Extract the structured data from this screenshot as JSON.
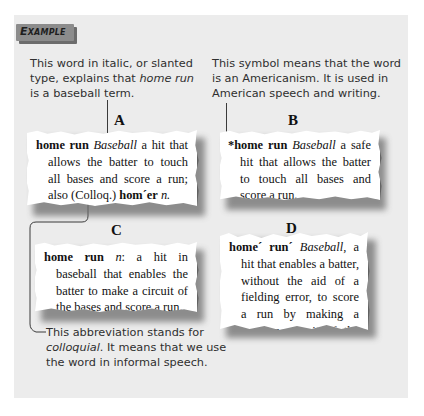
{
  "badge": {
    "label": "Example"
  },
  "annotations": {
    "italic_note": {
      "pre": "This word in italic, or slanted type, explains that ",
      "italic": "home run",
      "post": " is a baseball term."
    },
    "symbol_note": {
      "text": "This symbol means that the word is an Americanism. It is used in American speech and writing."
    },
    "abbrev_note": {
      "italic": "colloquial",
      "pre": "This abbreviation stands for ",
      "post": ". It means that we use the word in informal speech."
    }
  },
  "entries": [
    {
      "label": "A",
      "headword": "home run",
      "italic": "Baseball",
      "text": " a hit that allows the batter to touch all bases and score a run; also (Colloq.) ",
      "variant": "hom´er",
      "pos": "n."
    },
    {
      "label": "B",
      "marker": "*",
      "headword": "home run",
      "italic": "Baseball",
      "text": " a safe hit that allows the batter to touch all bases and score a run."
    },
    {
      "label": "C",
      "headword": "home run",
      "pos": "n",
      "text": ": a hit in baseball that enables the batter to make a circuit of the bases and score a run."
    },
    {
      "label": "D",
      "headword": "home´ run´",
      "italic": "Baseball",
      "text": ", a hit that enables a batter, without the aid of a fielding error, to score a run by making a nonstop circuit of the bases."
    }
  ],
  "colors": {
    "panel": "#ececec",
    "badge": "#8c8c8c",
    "badge_shadow": "#6c6c6c",
    "text": "#2f2f2f"
  }
}
